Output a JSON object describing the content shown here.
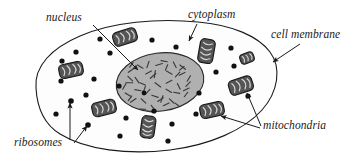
{
  "diagram": {
    "type": "biological-illustration",
    "background_color": "#ffffff",
    "width": 357,
    "height": 162,
    "labels": [
      {
        "id": "nucleus",
        "text": "nucleus",
        "x": 46,
        "y": 21,
        "anchor": "start"
      },
      {
        "id": "cytoplasm",
        "text": "cytoplasm",
        "x": 188,
        "y": 18,
        "anchor": "start"
      },
      {
        "id": "cell-membrane",
        "text": "cell membrane",
        "x": 271,
        "y": 38,
        "anchor": "start"
      },
      {
        "id": "mitochondria",
        "text": "mitochondria",
        "x": 263,
        "y": 129,
        "anchor": "start"
      },
      {
        "id": "ribosomes",
        "text": "ribosomes",
        "x": 14,
        "y": 146,
        "anchor": "start"
      }
    ],
    "colors": {
      "outline": "#1a1a1a",
      "cytoplasm_fill": "#fdfdfd",
      "nucleus_fill": "#b0b0b0",
      "nucleus_outline": "#2a2a2a",
      "chromatin": "#3a3a3a",
      "mitochondria_fill": "#555555",
      "mitochondria_outline": "#1a1a1a",
      "mitochondria_cristae": "#d8d8d8",
      "ribosome_fill": "#111111",
      "label_text": "#1a1a1a",
      "leader_line": "#2a2a2a"
    },
    "structures": {
      "cell_membrane": {
        "name": "cell membrane",
        "shape": "irregular-closed-outline",
        "path": "M 36,88 C 34,66 52,48 80,36 C 112,22 158,18 198,22 C 232,25 258,36 270,52 C 282,68 278,92 262,110 C 244,130 210,145 170,150 C 128,155 86,150 60,134 C 42,123 37,106 36,88 Z"
      },
      "nucleus": {
        "name": "nucleus",
        "shape": "ellipse",
        "cx": 160,
        "cy": 82,
        "rx": 44,
        "ry": 29,
        "rotation": -8,
        "chromatin_marks": 46
      },
      "mitochondria": {
        "name": "mitochondria",
        "count": 8,
        "shape": "rounded-rectangle-with-cristae",
        "items": [
          {
            "cx": 125,
            "cy": 37,
            "w": 24,
            "h": 14,
            "rot": -18
          },
          {
            "cx": 71,
            "cy": 70,
            "w": 24,
            "h": 14,
            "rot": -12
          },
          {
            "cx": 104,
            "cy": 108,
            "w": 24,
            "h": 14,
            "rot": -14
          },
          {
            "cx": 148,
            "cy": 127,
            "w": 14,
            "h": 22,
            "rot": 8
          },
          {
            "cx": 206,
            "cy": 51,
            "w": 15,
            "h": 24,
            "rot": 10
          },
          {
            "cx": 212,
            "cy": 110,
            "w": 24,
            "h": 14,
            "rot": -12
          },
          {
            "cx": 241,
            "cy": 86,
            "w": 24,
            "h": 15,
            "rot": -18
          },
          {
            "cx": 247,
            "cy": 58,
            "w": 14,
            "h": 10,
            "rot": -20
          }
        ]
      },
      "ribosomes": {
        "name": "ribosomes",
        "shape": "small-filled-circle",
        "radius": 2.6,
        "count": 26,
        "positions": [
          [
            100,
            39
          ],
          [
            76,
            52
          ],
          [
            62,
            61
          ],
          [
            110,
            53
          ],
          [
            152,
            40
          ],
          [
            176,
            47
          ],
          [
            61,
            81
          ],
          [
            86,
            95
          ],
          [
            71,
            101
          ],
          [
            94,
            79
          ],
          [
            119,
            86
          ],
          [
            126,
            118
          ],
          [
            154,
            111
          ],
          [
            172,
            124
          ],
          [
            196,
            114
          ],
          [
            199,
            93
          ],
          [
            216,
            72
          ],
          [
            234,
            66
          ],
          [
            211,
            46
          ],
          [
            231,
            48
          ],
          [
            120,
            136
          ],
          [
            168,
            141
          ],
          [
            144,
            93
          ],
          [
            248,
            96
          ],
          [
            56,
            114
          ],
          [
            88,
            124
          ]
        ]
      }
    },
    "leader_lines": [
      {
        "id": "nucleus-leader",
        "from_label": "nucleus",
        "arrow_to": [
          138,
          70
        ],
        "path": "M 93,25 L 138,70",
        "arrowhead": true
      },
      {
        "id": "cytoplasm-leader",
        "from_label": "cytoplasm",
        "arrow_to": [
          188,
          42
        ],
        "path": "M 197,24 L 189,41",
        "arrowhead": true
      },
      {
        "id": "cell-membrane-leader",
        "from_label": "cell membrane",
        "arrow_to": [
          272,
          62
        ],
        "path": "M 300,44 L 273,62",
        "arrowhead": true
      },
      {
        "id": "mitochondria-leader-upper",
        "from_label": "mitochondria",
        "arrow_to": [
          246,
          92
        ],
        "path": "M 261,126 L 247,93",
        "arrowhead": true
      },
      {
        "id": "mitochondria-leader-lower",
        "from_label": "mitochondria",
        "arrow_to": [
          219,
          115
        ],
        "path": "M 260,128 L 221,116",
        "arrowhead": true
      },
      {
        "id": "ribosomes-leader-upper",
        "from_label": "ribosomes",
        "arrow_to": [
          70,
          102
        ],
        "path": "M 70,140 L 70,103",
        "arrowhead": true
      },
      {
        "id": "ribosomes-leader-lower",
        "from_label": "ribosomes",
        "arrow_to": [
          88,
          125
        ],
        "path": "M 74,143 L 87,126",
        "arrowhead": true
      }
    ]
  }
}
